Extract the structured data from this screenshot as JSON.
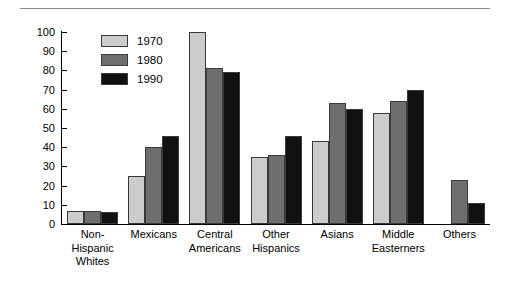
{
  "figure": {
    "top_rule": true,
    "ylabel": "Percentage"
  },
  "legend": {
    "position": "top-left-inside",
    "entries": [
      {
        "label": "1970",
        "color": "#cccccc"
      },
      {
        "label": "1980",
        "color": "#6e6e6e"
      },
      {
        "label": "1990",
        "color": "#111111"
      }
    ]
  },
  "chart_data": {
    "type": "bar",
    "title": "",
    "xlabel": "",
    "ylabel": "Percentage",
    "ylim": [
      0,
      100
    ],
    "yticks": [
      0,
      10,
      20,
      30,
      40,
      50,
      60,
      70,
      80,
      90,
      100
    ],
    "grid": false,
    "categories": [
      "Non-\nHispanic\nWhites",
      "Mexicans",
      "Central\nAmericans",
      "Other\nHispanics",
      "Asians",
      "Middle\nEasterners",
      "Others"
    ],
    "series": [
      {
        "name": "1970",
        "color": "#cccccc",
        "values": [
          7,
          25,
          100,
          35,
          43,
          58,
          null
        ]
      },
      {
        "name": "1980",
        "color": "#6e6e6e",
        "values": [
          7,
          40,
          81,
          36,
          63,
          64,
          23
        ]
      },
      {
        "name": "1990",
        "color": "#111111",
        "values": [
          6,
          46,
          79,
          46,
          60,
          70,
          11
        ]
      }
    ]
  }
}
